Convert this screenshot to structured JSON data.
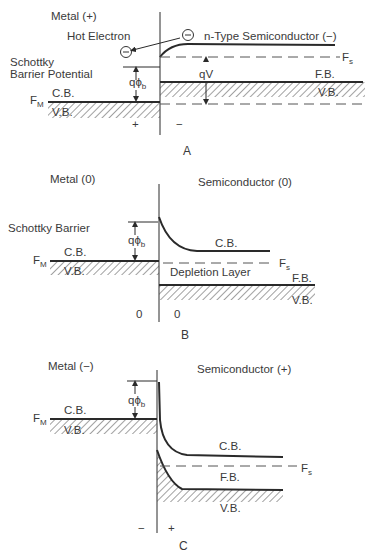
{
  "figure": {
    "colors": {
      "ink": "#2a2a2a",
      "text": "#3a3a3a",
      "background": "#ffffff"
    },
    "panels": [
      {
        "id": "A",
        "caption": "A",
        "metal_label": "Metal (+)",
        "semiconductor_label": "n-Type Semiconductor (−)",
        "hot_electron_label": "Hot Electron",
        "barrier_label_line1": "Schottky",
        "barrier_label_line2": "Barrier Potential",
        "qphi_label": "qϕ",
        "qphi_sub": "b",
        "qv_label": "qV",
        "fm_label": "F",
        "fm_sub": "M",
        "fs_label": "F",
        "fs_sub": "s",
        "metal_cb": "C.B.",
        "metal_vb": "V.B.",
        "semi_fb": "F.B.",
        "semi_vb": "V.B.",
        "metal_sign": "+",
        "semi_sign": "−",
        "electron_symbol": "−"
      },
      {
        "id": "B",
        "caption": "B",
        "metal_label": "Metal (0)",
        "semiconductor_label": "Semiconductor (0)",
        "barrier_label": "Schottky Barrier",
        "qphi_label": "qϕ",
        "qphi_sub": "b",
        "fm_label": "F",
        "fm_sub": "M",
        "fs_label": "F",
        "fs_sub": "s",
        "metal_cb": "C.B.",
        "metal_vb": "V.B.",
        "semi_cb": "C.B.",
        "semi_fb": "F.B.",
        "semi_vb": "V.B.",
        "depletion_label": "Depletion Layer",
        "metal_sign": "0",
        "semi_sign": "0"
      },
      {
        "id": "C",
        "caption": "C",
        "metal_label": "Metal (−)",
        "semiconductor_label": "Semiconductor (+)",
        "qphi_label": "qϕ",
        "qphi_sub": "b",
        "fm_label": "F",
        "fm_sub": "M",
        "fs_label": "F",
        "fs_sub": "s",
        "metal_cb": "C.B.",
        "metal_vb": "V.B.",
        "semi_cb": "C.B.",
        "semi_fb": "F.B.",
        "semi_vb": "V.B.",
        "metal_sign": "−",
        "semi_sign": "+"
      }
    ]
  }
}
